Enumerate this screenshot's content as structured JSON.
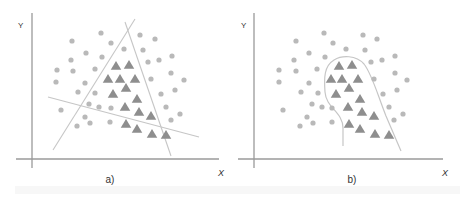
{
  "colors": {
    "axis": "#9a9a9a",
    "boundary": "#c6c6c6",
    "circle": "#b9b9b9",
    "triangle": "#8e8e8e",
    "text": "#333333"
  },
  "panels": [
    {
      "id": "a",
      "caption": "a)",
      "x_label": "X",
      "y_label": "Y",
      "description": "Linear decision boundaries (three straight lines) separating triangle class from circle class",
      "axis": {
        "x0": 32,
        "y_top": 13,
        "y_bottom": 168,
        "y0": 159,
        "x_left": 16,
        "x_right": 219
      },
      "labels": {
        "y": [
          18,
          28
        ],
        "x": [
          218,
          176
        ],
        "caption": [
          110,
          183
        ]
      },
      "boundaries": [
        {
          "type": "line",
          "points": [
            [
              53,
              150
            ],
            [
              135,
              19
            ]
          ]
        },
        {
          "type": "line",
          "points": [
            [
              125,
              22
            ],
            [
              171,
              156
            ]
          ]
        },
        {
          "type": "line",
          "points": [
            [
              48,
              97
            ],
            [
              199,
              137
            ]
          ]
        }
      ],
      "circles": [
        [
          101,
          33
        ],
        [
          72,
          41
        ],
        [
          111,
          43
        ],
        [
          140,
          35
        ],
        [
          155,
          39
        ],
        [
          124,
          49
        ],
        [
          86,
          53
        ],
        [
          143,
          50
        ],
        [
          71,
          60
        ],
        [
          102,
          57
        ],
        [
          148,
          62
        ],
        [
          159,
          60
        ],
        [
          172,
          56
        ],
        [
          57,
          70
        ],
        [
          73,
          71
        ],
        [
          95,
          69
        ],
        [
          171,
          73
        ],
        [
          56,
          82
        ],
        [
          85,
          83
        ],
        [
          151,
          79
        ],
        [
          184,
          80
        ],
        [
          78,
          92
        ],
        [
          95,
          93
        ],
        [
          161,
          94
        ],
        [
          175,
          90
        ],
        [
          89,
          104
        ],
        [
          99,
          107
        ],
        [
          111,
          108
        ],
        [
          166,
          107
        ],
        [
          61,
          110
        ],
        [
          85,
          117
        ],
        [
          180,
          114
        ],
        [
          77,
          126
        ],
        [
          90,
          123
        ],
        [
          110,
          122
        ],
        [
          171,
          120
        ]
      ],
      "triangles": [
        [
          116,
          66
        ],
        [
          129,
          65
        ],
        [
          108,
          79
        ],
        [
          120,
          79
        ],
        [
          135,
          79
        ],
        [
          126,
          88
        ],
        [
          113,
          94
        ],
        [
          137,
          99
        ],
        [
          125,
          107
        ],
        [
          139,
          112
        ],
        [
          151,
          116
        ],
        [
          126,
          124
        ],
        [
          137,
          129
        ],
        [
          152,
          134
        ],
        [
          166,
          135
        ]
      ]
    },
    {
      "id": "b",
      "caption": "b)",
      "x_label": "X",
      "y_label": "Y",
      "description": "Non-linear (curved) decision boundary enclosing triangle class",
      "axis": {
        "x0": 254,
        "y_top": 13,
        "y_bottom": 168,
        "y0": 159,
        "x_left": 238,
        "x_right": 443
      },
      "labels": {
        "y": [
          241,
          28
        ],
        "x": [
          442,
          176
        ],
        "caption": [
          352,
          183
        ]
      },
      "boundaries": [
        {
          "type": "curve",
          "path": "M343,146 L343,128 C343,112 326,108 325,92 C324,78 324,66 334,60 C342,55 356,55 364,64 C372,74 378,96 386,116 C392,130 397,142 401,151"
        }
      ],
      "circles": [
        [
          324,
          33
        ],
        [
          296,
          41
        ],
        [
          333,
          43
        ],
        [
          363,
          35
        ],
        [
          377,
          39
        ],
        [
          346,
          49
        ],
        [
          309,
          53
        ],
        [
          365,
          50
        ],
        [
          294,
          60
        ],
        [
          325,
          57
        ],
        [
          371,
          62
        ],
        [
          382,
          60
        ],
        [
          395,
          56
        ],
        [
          279,
          70
        ],
        [
          296,
          71
        ],
        [
          317,
          69
        ],
        [
          395,
          73
        ],
        [
          279,
          82
        ],
        [
          309,
          83
        ],
        [
          374,
          79
        ],
        [
          407,
          80
        ],
        [
          301,
          92
        ],
        [
          318,
          93
        ],
        [
          383,
          94
        ],
        [
          397,
          90
        ],
        [
          312,
          104
        ],
        [
          322,
          107
        ],
        [
          332,
          108
        ],
        [
          389,
          107
        ],
        [
          283,
          110
        ],
        [
          307,
          117
        ],
        [
          403,
          114
        ],
        [
          300,
          126
        ],
        [
          313,
          123
        ],
        [
          332,
          122
        ],
        [
          394,
          120
        ]
      ],
      "triangles": [
        [
          339,
          66
        ],
        [
          352,
          65
        ],
        [
          331,
          79
        ],
        [
          342,
          79
        ],
        [
          358,
          79
        ],
        [
          349,
          88
        ],
        [
          336,
          94
        ],
        [
          360,
          99
        ],
        [
          348,
          107
        ],
        [
          362,
          112
        ],
        [
          374,
          116
        ],
        [
          349,
          124
        ],
        [
          360,
          129
        ],
        [
          375,
          134
        ],
        [
          389,
          135
        ]
      ]
    }
  ]
}
